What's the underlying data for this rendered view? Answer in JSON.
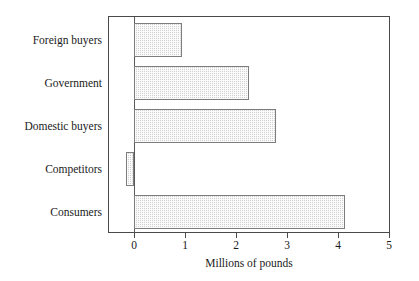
{
  "chart_data": {
    "type": "bar",
    "orientation": "horizontal",
    "title": "",
    "subtitle": "",
    "xlabel": "Millions of pounds",
    "ylabel": "",
    "categories": [
      "Foreign buyers",
      "Government",
      "Domestic buyers",
      "Competitors",
      "Consumers"
    ],
    "values": [
      0.95,
      2.25,
      2.78,
      -0.15,
      4.14
    ],
    "series": [
      {
        "name": "Millions of pounds",
        "values": [
          0.95,
          2.25,
          2.78,
          -0.15,
          4.14
        ]
      }
    ],
    "xlim": [
      -0.5,
      5
    ],
    "xticks": [
      0,
      1,
      2,
      3,
      4,
      5
    ],
    "xtick_labels": [
      "0",
      "1",
      "2",
      "3",
      "4",
      "5"
    ],
    "grid": false,
    "legend": false,
    "legend_position": "none",
    "bar_fill_color": "#d2d2d2",
    "bar_border_color": "#7d7d7d",
    "frame_color": "#4a4a4a",
    "background_color": "#ffffff",
    "category_order": "top-to-bottom"
  }
}
